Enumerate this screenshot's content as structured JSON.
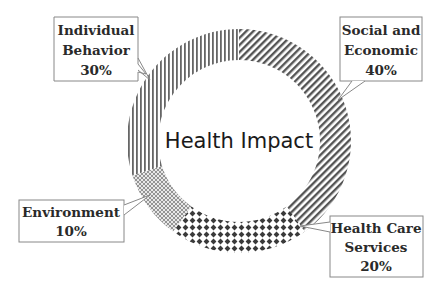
{
  "chart_data": {
    "type": "pie",
    "variant": "donut",
    "title": "Health Impact",
    "categories": [
      "Social and Economic",
      "Health Care Services",
      "Environment",
      "Individual Behavior"
    ],
    "values": [
      40,
      20,
      10,
      30
    ],
    "unit": "%",
    "labels": [
      {
        "name": "Social and Economic",
        "lines": [
          "Social and",
          "Economic"
        ],
        "value_text": "40%",
        "pattern": "diagonal-stripes"
      },
      {
        "name": "Health Care Services",
        "lines": [
          "Health Care",
          "Services"
        ],
        "value_text": "20%",
        "pattern": "diamond-dots"
      },
      {
        "name": "Environment",
        "lines": [
          "Environment"
        ],
        "value_text": "10%",
        "pattern": "fine-crosshatch"
      },
      {
        "name": "Individual Behavior",
        "lines": [
          "Individual",
          "Behavior"
        ],
        "value_text": "30%",
        "pattern": "vertical-lines"
      }
    ],
    "start_angle_deg": 0,
    "direction": "clockwise",
    "legend": "none (callout labels)"
  },
  "colors": {
    "pattern_ink": "#555555",
    "label_border": "#888888",
    "text": "#2a2a2a",
    "background": "#ffffff"
  }
}
